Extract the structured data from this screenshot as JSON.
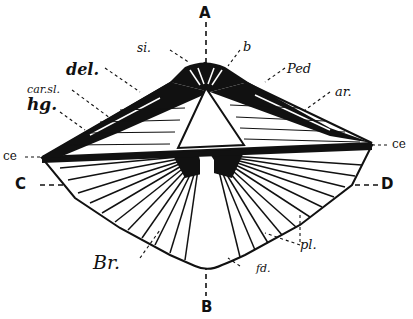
{
  "diagram": {
    "colors": {
      "ink": "#111111",
      "paper": "#ffffff"
    },
    "axes": {
      "vertical_top": "A",
      "vertical_bottom": "B",
      "horizontal_left": "C",
      "horizontal_right": "D"
    },
    "labels": {
      "si": "si.",
      "b": "b",
      "del": "del.",
      "ped": "Ped",
      "car_sl": "car.sl.",
      "hg": "hg.",
      "ar": "ar.",
      "ce_left": "ce",
      "ce_right": "ce",
      "br": "Br.",
      "pl": "pl.",
      "fd": "fd."
    }
  }
}
